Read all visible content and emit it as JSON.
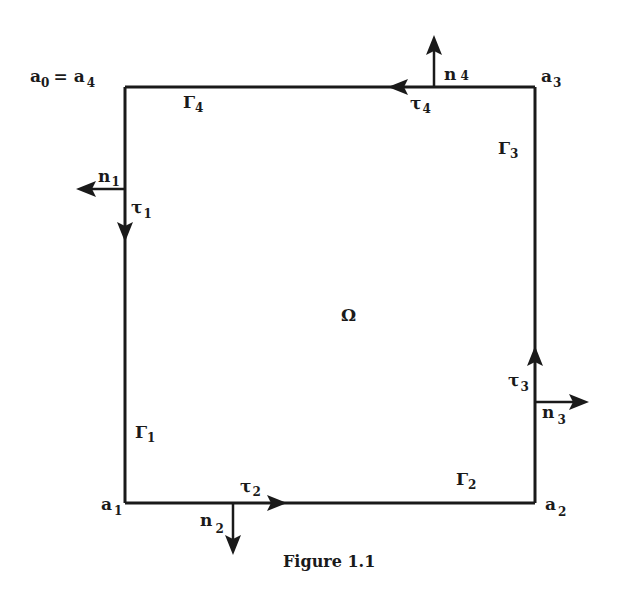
{
  "figure": {
    "caption": "Figure 1.1",
    "domain_label": "Ω",
    "colors": {
      "ink": "#1a1a1a",
      "background": "#ffffff"
    }
  },
  "vertices": {
    "a0_a4": {
      "base": "a",
      "sub0": "0",
      "eq": "=",
      "sub4": "4"
    },
    "a1": {
      "base": "a",
      "sub": "1"
    },
    "a2": {
      "base": "a",
      "sub": "2"
    },
    "a3": {
      "base": "a",
      "sub": "3"
    }
  },
  "boundaries": {
    "gamma1": {
      "base": "Γ",
      "sub": "1"
    },
    "gamma2": {
      "base": "Γ",
      "sub": "2"
    },
    "gamma3": {
      "base": "Γ",
      "sub": "3"
    },
    "gamma4": {
      "base": "Γ",
      "sub": "4"
    }
  },
  "normals": {
    "n1": {
      "base": "n",
      "sub": "1",
      "direction": "left"
    },
    "n2": {
      "base": "n",
      "sub": "2",
      "direction": "down"
    },
    "n3": {
      "base": "n",
      "sub": "3",
      "direction": "right"
    },
    "n4": {
      "base": "n",
      "sub": "4",
      "direction": "up"
    }
  },
  "tangents": {
    "tau1": {
      "base": "τ",
      "sub": "1",
      "direction": "down"
    },
    "tau2": {
      "base": "τ",
      "sub": "2",
      "direction": "right"
    },
    "tau3": {
      "base": "τ",
      "sub": "3",
      "direction": "up"
    },
    "tau4": {
      "base": "τ",
      "sub": "4",
      "direction": "left"
    }
  }
}
